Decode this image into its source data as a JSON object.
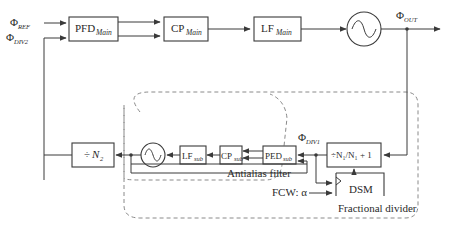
{
  "diagram": {
    "inputs": {
      "ref": {
        "symbol": "Φ",
        "sub": "REF"
      },
      "div2": {
        "symbol": "Φ",
        "sub": "DIV2"
      }
    },
    "output": {
      "symbol": "Φ",
      "sub": "OUT"
    },
    "div1_label": {
      "symbol": "Φ",
      "sub": "DIV1"
    },
    "main_loop": {
      "pfd": {
        "base": "PFD",
        "sub": "Main"
      },
      "cp": {
        "base": "CP",
        "sub": "Main"
      },
      "lf": {
        "base": "LF",
        "sub": "Main"
      },
      "vco": {
        "icon": "sine-wave-oscillator"
      }
    },
    "sub_loop": {
      "ped": {
        "base": "PED",
        "sub": "sub"
      },
      "cp": {
        "base": "CP",
        "sub": "sub"
      },
      "lf": {
        "base": "LF",
        "sub": "sub"
      },
      "vco": {
        "icon": "sine-wave-oscillator"
      },
      "group_label": "Antialias filter"
    },
    "dividers": {
      "n2": {
        "prefix": "÷",
        "text": "N",
        "sub": "2"
      },
      "n1": {
        "label": "÷N₁/N₁ + 1"
      }
    },
    "dsm": {
      "label": "DSM"
    },
    "fcw": {
      "label": "FCW: α"
    },
    "fractional_group_label": "Fractional divider"
  }
}
